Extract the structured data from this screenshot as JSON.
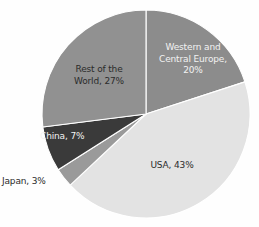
{
  "chart_data": {
    "type": "pie",
    "title": "",
    "subtitle": "",
    "xlabel": "",
    "ylabel": "",
    "legend_position": "none",
    "grid": false,
    "units": "percent",
    "categories": [
      "Western and Central Europe",
      "USA",
      "Japan",
      "China",
      "Rest of the World"
    ],
    "values": [
      20,
      43,
      3,
      7,
      27
    ],
    "slices": [
      {
        "name": "Western and Central Europe",
        "value": 20,
        "label": "Western and\nCentral Europe,\n20%",
        "percent_text": "20%",
        "color": "#8c8c8c",
        "text_color": "#f2f2f2",
        "label_placement": "inside",
        "start_angle_deg": 0,
        "end_angle_deg": 72
      },
      {
        "name": "USA",
        "value": 43,
        "label": "USA, 43%",
        "percent_text": "43%",
        "color": "#e3e3e3",
        "text_color": "#2b2b2b",
        "label_placement": "inside",
        "start_angle_deg": 72,
        "end_angle_deg": 226.8
      },
      {
        "name": "Japan",
        "value": 3,
        "label": "Japan, 3%",
        "percent_text": "3%",
        "color": "#9a9a9a",
        "text_color": "#2b2b2b",
        "label_placement": "outside",
        "start_angle_deg": 226.8,
        "end_angle_deg": 237.6
      },
      {
        "name": "China",
        "value": 7,
        "label": "China, 7%",
        "percent_text": "7%",
        "color": "#3a3a3a",
        "text_color": "#f2f2f2",
        "label_placement": "inside",
        "start_angle_deg": 237.6,
        "end_angle_deg": 262.8
      },
      {
        "name": "Rest of the World",
        "value": 27,
        "label": "Rest of the\nWorld, 27%",
        "percent_text": "27%",
        "color": "#919191",
        "text_color": "#2b2b2b",
        "label_placement": "inside",
        "start_angle_deg": 262.8,
        "end_angle_deg": 360
      }
    ],
    "background_color": "#fefefe",
    "slice_border_color": "#ffffff",
    "center_x": 146,
    "center_y": 114,
    "radius": 104
  }
}
